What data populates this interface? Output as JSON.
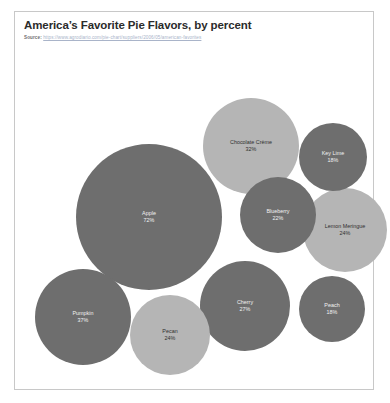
{
  "chart_data": {
    "type": "bubble",
    "title": "America’s Favorite Pie Flavors, by percent",
    "source_label": "Source:",
    "source_url": "https://www.agrodiario.com/pie-chart/suppliers/2006/05/american-favorites",
    "xlabel": "",
    "ylabel": "",
    "grid": false,
    "legend": "none",
    "value_suffix": "%",
    "colors": {
      "dark_bubble": "#6e6e6e",
      "light_bubble": "#b5b5b5",
      "dark_bubble_text": "#f2f2f2",
      "light_bubble_text": "#2f2f2f",
      "card_border": "#c8c8c8",
      "title_text": "#2b2b2b",
      "source_text": "#8d8d8d",
      "background": "#ffffff"
    },
    "categories": [
      "Apple",
      "Pumpkin",
      "Chocolate Crème",
      "Cherry",
      "Lemon Meringue",
      "Pecan",
      "Blueberry",
      "Key Lime",
      "Peach"
    ],
    "values": [
      72,
      37,
      32,
      27,
      24,
      24,
      22,
      18,
      18
    ],
    "bubbles": [
      {
        "label": "Apple",
        "value": 72,
        "value_text": "72%",
        "shade": "dark",
        "cx": 134,
        "cy": 175,
        "r": 73
      },
      {
        "label": "Pumpkin",
        "value": 37,
        "value_text": "37%",
        "shade": "dark",
        "cx": 68,
        "cy": 275,
        "r": 48
      },
      {
        "label": "Chocolate Crème",
        "value": 32,
        "value_text": "32%",
        "shade": "light",
        "cx": 236,
        "cy": 104,
        "r": 48
      },
      {
        "label": "Cherry",
        "value": 27,
        "value_text": "27%",
        "shade": "dark",
        "cx": 230,
        "cy": 264,
        "r": 45
      },
      {
        "label": "Lemon Meringue",
        "value": 24,
        "value_text": "24%",
        "shade": "light",
        "cx": 330,
        "cy": 188,
        "r": 42
      },
      {
        "label": "Pecan",
        "value": 24,
        "value_text": "24%",
        "shade": "light",
        "cx": 155,
        "cy": 293,
        "r": 40
      },
      {
        "label": "Blueberry",
        "value": 22,
        "value_text": "22%",
        "shade": "dark",
        "cx": 263,
        "cy": 173,
        "r": 38
      },
      {
        "label": "Key Lime",
        "value": 18,
        "value_text": "18%",
        "shade": "dark",
        "cx": 318,
        "cy": 115,
        "r": 34
      },
      {
        "label": "Peach",
        "value": 18,
        "value_text": "18%",
        "shade": "dark",
        "cx": 317,
        "cy": 267,
        "r": 33
      }
    ]
  }
}
